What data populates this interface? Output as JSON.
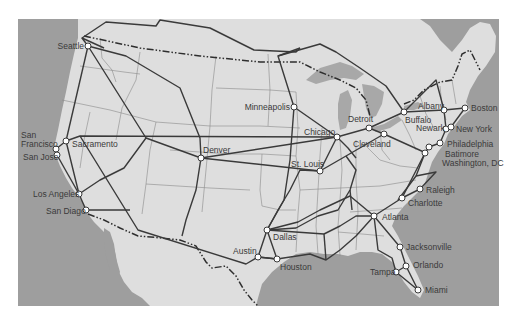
{
  "map": {
    "title": "US intercity rail network map",
    "colors": {
      "water": "#9e9e9e",
      "land": "#dedede",
      "background": "#ffffff",
      "route": "#3a3a3a",
      "state_border": "#8a8a8a",
      "node_fill": "#ffffff"
    },
    "cities": [
      {
        "name": "Seattle",
        "x": 88,
        "y": 46,
        "lx": 84,
        "ly": 49,
        "anchor": "end"
      },
      {
        "name": "San Francisco",
        "x": 56,
        "y": 149,
        "lx": 21,
        "ly": 138,
        "anchor": "start",
        "multiline": [
          "San",
          "Francisco"
        ]
      },
      {
        "name": "San Jose",
        "x": 57,
        "y": 155,
        "lx": 23,
        "ly": 160,
        "anchor": "start"
      },
      {
        "name": "Sacramento",
        "x": 66,
        "y": 141,
        "lx": 72,
        "ly": 147,
        "anchor": "start"
      },
      {
        "name": "Los Angeles",
        "x": 79,
        "y": 194,
        "lx": 33,
        "ly": 197,
        "anchor": "start"
      },
      {
        "name": "San Diago",
        "x": 86,
        "y": 210,
        "lx": 46,
        "ly": 214,
        "anchor": "start"
      },
      {
        "name": "Denver",
        "x": 201,
        "y": 158,
        "lx": 203,
        "ly": 153,
        "anchor": "start"
      },
      {
        "name": "Minneapolis",
        "x": 294,
        "y": 107,
        "lx": 290,
        "ly": 110,
        "anchor": "end"
      },
      {
        "name": "Chicago",
        "x": 337,
        "y": 137,
        "lx": 304,
        "ly": 135,
        "anchor": "start"
      },
      {
        "name": "Detroit",
        "x": 369,
        "y": 128,
        "lx": 348,
        "ly": 122,
        "anchor": "start"
      },
      {
        "name": "Cleveland",
        "x": 384,
        "y": 134,
        "lx": 353,
        "ly": 147,
        "anchor": "start"
      },
      {
        "name": "St. Louis",
        "x": 320,
        "y": 171,
        "lx": 291,
        "ly": 167,
        "anchor": "start"
      },
      {
        "name": "Buffalo",
        "x": 404,
        "y": 112,
        "lx": 405,
        "ly": 123,
        "anchor": "start"
      },
      {
        "name": "Albany",
        "x": 444,
        "y": 110,
        "lx": 418,
        "ly": 109,
        "anchor": "start"
      },
      {
        "name": "Boston",
        "x": 465,
        "y": 108,
        "lx": 471,
        "ly": 111,
        "anchor": "start"
      },
      {
        "name": "Newark",
        "x": 446,
        "y": 129,
        "lx": 416,
        "ly": 131,
        "anchor": "start"
      },
      {
        "name": "New York",
        "x": 451,
        "y": 127,
        "lx": 456,
        "ly": 132,
        "anchor": "start"
      },
      {
        "name": "Philadelphia",
        "x": 440,
        "y": 143,
        "lx": 447,
        "ly": 147,
        "anchor": "start"
      },
      {
        "name": "Batimore",
        "x": 429,
        "y": 147,
        "lx": 445,
        "ly": 157,
        "anchor": "start"
      },
      {
        "name": "Washington, DC",
        "x": 425,
        "y": 153,
        "lx": 442,
        "ly": 166,
        "anchor": "start"
      },
      {
        "name": "Raleigh",
        "x": 420,
        "y": 189,
        "lx": 426,
        "ly": 193,
        "anchor": "start"
      },
      {
        "name": "Charlotte",
        "x": 402,
        "y": 198,
        "lx": 408,
        "ly": 206,
        "anchor": "start"
      },
      {
        "name": "Atlanta",
        "x": 374,
        "y": 216,
        "lx": 382,
        "ly": 220,
        "anchor": "start"
      },
      {
        "name": "Jacksonville",
        "x": 400,
        "y": 247,
        "lx": 406,
        "ly": 250,
        "anchor": "start"
      },
      {
        "name": "Orlando",
        "x": 406,
        "y": 266,
        "lx": 413,
        "ly": 268,
        "anchor": "start"
      },
      {
        "name": "Tampa",
        "x": 396,
        "y": 272,
        "lx": 370,
        "ly": 275,
        "anchor": "start"
      },
      {
        "name": "Miami",
        "x": 418,
        "y": 290,
        "lx": 425,
        "ly": 293,
        "anchor": "start"
      },
      {
        "name": "Dallas",
        "x": 267,
        "y": 230,
        "lx": 273,
        "ly": 240,
        "anchor": "start"
      },
      {
        "name": "Austin",
        "x": 258,
        "y": 257,
        "lx": 233,
        "ly": 254,
        "anchor": "start"
      },
      {
        "name": "Houston",
        "x": 277,
        "y": 259,
        "lx": 280,
        "ly": 270,
        "anchor": "start"
      }
    ]
  }
}
